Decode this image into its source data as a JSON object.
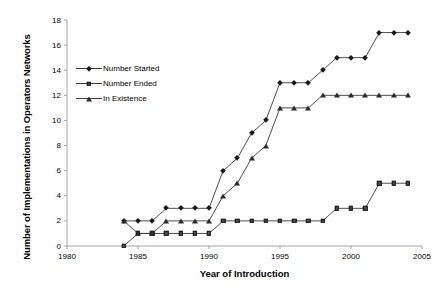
{
  "chart_data": {
    "type": "line",
    "title": "",
    "xlabel": "Year of Introduction",
    "ylabel": "Number of Implementations in Operators Networks",
    "xlim": [
      1980,
      2005
    ],
    "ylim": [
      0,
      18
    ],
    "xticks": [
      1980,
      1985,
      1990,
      1995,
      2000,
      2005
    ],
    "yticks": [
      0,
      2,
      4,
      6,
      8,
      10,
      12,
      14,
      16,
      18
    ],
    "grid": false,
    "legend_position": "upper-left-inside",
    "x": [
      1984,
      1985,
      1986,
      1987,
      1988,
      1989,
      1990,
      1991,
      1992,
      1993,
      1994,
      1995,
      1996,
      1997,
      1998,
      1999,
      2000,
      2001,
      2002,
      2003,
      2004
    ],
    "series": [
      {
        "name": "Number Started",
        "marker": "diamond",
        "color": "#1a1a1a",
        "values": [
          2,
          2,
          2,
          3,
          3,
          3,
          3,
          6,
          7,
          9,
          10,
          13,
          13,
          13,
          14,
          15,
          15,
          15,
          17,
          17,
          17
        ]
      },
      {
        "name": "Number Ended",
        "marker": "square",
        "color": "#4a4a4a",
        "values": [
          0,
          1,
          1,
          1,
          1,
          1,
          1,
          2,
          2,
          2,
          2,
          2,
          2,
          2,
          2,
          3,
          3,
          3,
          5,
          5,
          5
        ]
      },
      {
        "name": "In Existence",
        "marker": "triangle",
        "color": "#8a8a8a",
        "values": [
          2,
          1,
          1,
          2,
          2,
          2,
          2,
          4,
          5,
          7,
          8,
          11,
          11,
          11,
          12,
          12,
          12,
          12,
          12,
          12,
          12
        ]
      }
    ]
  },
  "axes": {
    "x_title": "Year of Introduction",
    "y_title": "Number of Implementations in Operators Networks",
    "x_tick_labels": [
      "1980",
      "1985",
      "1990",
      "1995",
      "2000",
      "2005"
    ],
    "y_tick_labels": [
      "0",
      "2",
      "4",
      "6",
      "8",
      "10",
      "12",
      "14",
      "16",
      "18"
    ]
  },
  "legend": {
    "items": [
      {
        "label": "Number Started",
        "marker": "diamond-icon"
      },
      {
        "label": "Number Ended",
        "marker": "square-icon"
      },
      {
        "label": "In Existence",
        "marker": "triangle-icon"
      }
    ]
  },
  "colors": {
    "axis": "#9a9a9a",
    "line": "#3a3a3a",
    "text": "#000000",
    "background": "#ffffff"
  }
}
